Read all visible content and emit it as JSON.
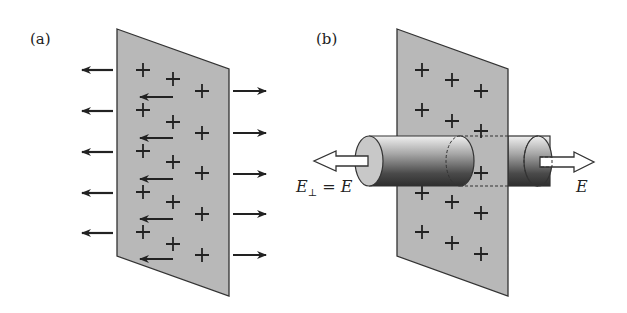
{
  "figure": {
    "panels": [
      {
        "id": "a",
        "label": "(a)",
        "description": "Infinite plane of positive charge with field arrows pointing away on both sides",
        "charge_symbol": "+",
        "charge_rows": 6,
        "charge_cols": 3,
        "left_arrows": 5,
        "right_arrows": 5,
        "behind_arrows": 5
      },
      {
        "id": "b",
        "label": "(b)",
        "description": "Gaussian cylinder piercing a charged plane, flux through end caps",
        "charge_symbol": "+",
        "left_field_label": "E⊥ = E",
        "left_field_label_main": "E",
        "left_field_label_sub": "⊥",
        "left_field_label_rest": " = E",
        "right_field_label": "E"
      }
    ],
    "colors": {
      "sheet_fill": "#b8b8b8",
      "sheet_edge": "#333333",
      "arrow": "#222222",
      "cylinder_dark": "#3a3a3a",
      "cylinder_light": "#e0e0e0"
    }
  }
}
